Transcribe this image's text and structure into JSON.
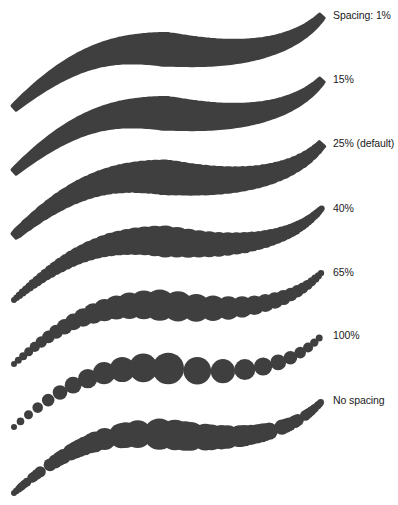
{
  "figure": {
    "ink_color": "#3f3f40",
    "background": "#ffffff",
    "rows": [
      {
        "label": "Spacing: 1%",
        "spacing": 1,
        "mode": "solid",
        "label_x": 333,
        "label_y": 9,
        "offset_y": 0
      },
      {
        "label": "15%",
        "spacing": 15,
        "mode": "solid",
        "label_x": 333,
        "label_y": 73,
        "offset_y": 64
      },
      {
        "label": "25% (default)",
        "spacing": 25,
        "mode": "scallop",
        "label_x": 333,
        "label_y": 137,
        "offset_y": 128
      },
      {
        "label": "40%",
        "spacing": 40,
        "mode": "beads",
        "label_x": 333,
        "label_y": 202,
        "offset_y": 192
      },
      {
        "label": "65%",
        "spacing": 65,
        "mode": "beads",
        "label_x": 333,
        "label_y": 266,
        "offset_y": 256
      },
      {
        "label": "100%",
        "spacing": 100,
        "mode": "dots",
        "label_x": 333,
        "label_y": 329,
        "offset_y": 319
      },
      {
        "label": "No spacing",
        "spacing": null,
        "mode": "clumps",
        "label_x": 333,
        "label_y": 394,
        "offset_y": 385
      }
    ]
  }
}
